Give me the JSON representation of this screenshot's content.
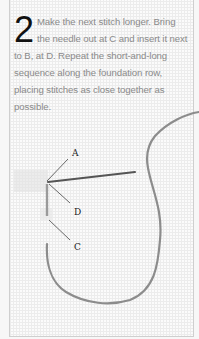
{
  "step": {
    "number": "2",
    "text": "Make the next stitch longer. Bring the needle out at C and insert it next to B, at D. Repeat the short-and-long sequence along the foundation row, placing stitches as close together as possible."
  },
  "diagram": {
    "labels": {
      "a": "A",
      "d": "D",
      "c": "C"
    },
    "colors": {
      "thread": "#8c8c8c",
      "needle": "#555555",
      "leader": "#333333"
    }
  }
}
